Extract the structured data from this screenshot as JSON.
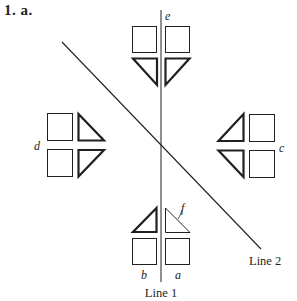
{
  "heading": "1.  a.",
  "lines": {
    "line1": {
      "label": "Line 1",
      "x1": 161,
      "y1": 10,
      "x2": 161,
      "y2": 282
    },
    "line2": {
      "label": "Line 2",
      "x1": 62,
      "y1": 42,
      "x2": 261,
      "y2": 249
    }
  },
  "labels": {
    "a": "a",
    "b": "b",
    "c": "c",
    "d": "d",
    "e": "e",
    "f": "f"
  },
  "colors": {
    "ink": "#231f20",
    "background": "#ffffff"
  }
}
